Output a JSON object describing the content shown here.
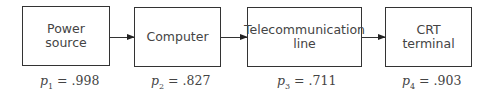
{
  "diagram": {
    "type": "series-reliability-block-diagram",
    "blocks": [
      {
        "label": "Power\nsource",
        "prob_var": "p",
        "prob_index": "1",
        "prob_value": ".998"
      },
      {
        "label": "Computer",
        "prob_var": "p",
        "prob_index": "2",
        "prob_value": ".827"
      },
      {
        "label": "Telecommunication\nline",
        "prob_var": "p",
        "prob_index": "3",
        "prob_value": ".711"
      },
      {
        "label": "CRT\nterminal",
        "prob_var": "p",
        "prob_index": "4",
        "prob_value": ".903"
      }
    ],
    "equals": "="
  }
}
